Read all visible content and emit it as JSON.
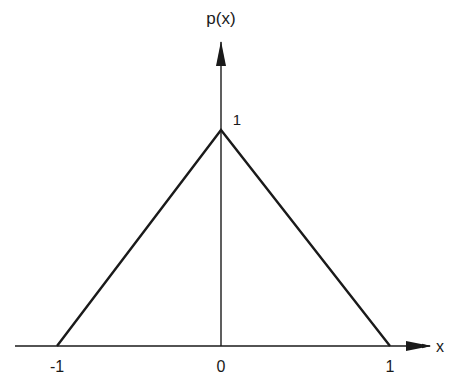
{
  "diagram": {
    "y_axis_label": "p(x)",
    "x_axis_label": "x",
    "peak_label": "1",
    "x_ticks": [
      "-1",
      "0",
      "1"
    ],
    "function": {
      "type": "triangle",
      "points": [
        [
          -1,
          0
        ],
        [
          0,
          1
        ],
        [
          1,
          0
        ]
      ]
    },
    "colors": {
      "line": "#1a1a1a",
      "background": "#ffffff"
    }
  }
}
